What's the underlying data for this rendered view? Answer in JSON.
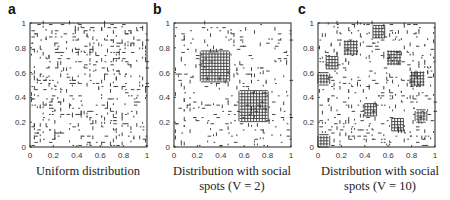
{
  "figure": {
    "panels": [
      {
        "letter": "a",
        "caption_line1": "Uniform distribution",
        "caption_line2": ""
      },
      {
        "letter": "b",
        "caption_line1": "Distribution with social",
        "caption_line2": "spots (V = 2)"
      },
      {
        "letter": "c",
        "caption_line1": "Distribution with social",
        "caption_line2": "spots (V = 10)"
      }
    ]
  },
  "chart_data": [
    {
      "type": "scatter",
      "title": "a",
      "caption": "Uniform distribution",
      "xlabel": "",
      "ylabel": "",
      "xlim": [
        0,
        1
      ],
      "ylim": [
        0,
        1
      ],
      "xticks": [
        "0",
        "0.2",
        "0.4",
        "0.6",
        "0.8",
        "1"
      ],
      "yticks": [
        "0",
        "0.2",
        "0.4",
        "0.6",
        "0.8",
        "1"
      ],
      "distribution": "uniform",
      "hotspots": [],
      "density": 1.0
    },
    {
      "type": "scatter",
      "title": "b",
      "caption": "Distribution with social spots (V = 2)",
      "xlabel": "",
      "ylabel": "",
      "xlim": [
        0,
        1
      ],
      "ylim": [
        0,
        1
      ],
      "xticks": [
        "0",
        "0.2",
        "0.4",
        "0.6",
        "0.8",
        "1"
      ],
      "yticks": [
        "0",
        "0.2",
        "0.4",
        "0.6",
        "0.8",
        "1"
      ],
      "distribution": "social_spots",
      "V": 2,
      "hotspots": [
        {
          "x": 0.35,
          "y": 0.65,
          "r": 0.12
        },
        {
          "x": 0.68,
          "y": 0.33,
          "r": 0.12
        }
      ],
      "density": 0.55
    },
    {
      "type": "scatter",
      "title": "c",
      "caption": "Distribution with social spots (V = 10)",
      "xlabel": "",
      "ylabel": "",
      "xlim": [
        0,
        1
      ],
      "ylim": [
        0,
        1
      ],
      "xticks": [
        "0",
        "0.2",
        "0.4",
        "0.6",
        "0.8",
        "1"
      ],
      "yticks": [
        "0",
        "0.2",
        "0.4",
        "0.6",
        "0.8",
        "1"
      ],
      "distribution": "social_spots",
      "V": 10,
      "hotspots": [
        {
          "x": 0.52,
          "y": 0.93,
          "r": 0.05
        },
        {
          "x": 0.28,
          "y": 0.8,
          "r": 0.06
        },
        {
          "x": 0.12,
          "y": 0.68,
          "r": 0.05
        },
        {
          "x": 0.65,
          "y": 0.72,
          "r": 0.06
        },
        {
          "x": 0.85,
          "y": 0.55,
          "r": 0.06
        },
        {
          "x": 0.05,
          "y": 0.55,
          "r": 0.04
        },
        {
          "x": 0.68,
          "y": 0.18,
          "r": 0.05
        },
        {
          "x": 0.05,
          "y": 0.05,
          "r": 0.04
        },
        {
          "x": 0.45,
          "y": 0.3,
          "r": 0.05
        },
        {
          "x": 0.88,
          "y": 0.25,
          "r": 0.04
        }
      ],
      "density": 0.75
    }
  ]
}
